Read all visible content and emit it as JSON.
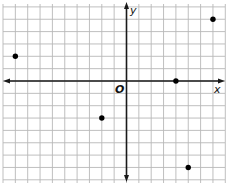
{
  "diagram": {
    "type": "coordinate-plane",
    "labels": {
      "x_axis": "x",
      "y_axis": "y",
      "origin": "O"
    },
    "grid": {
      "x_min": -10,
      "x_max": 8,
      "y_min": -8,
      "y_max": 6,
      "step": 1
    },
    "points": [
      {
        "x": -9,
        "y": 2
      },
      {
        "x": 7,
        "y": 5
      },
      {
        "x": 4,
        "y": 0
      },
      {
        "x": -2,
        "y": -3
      },
      {
        "x": 5,
        "y": -7
      }
    ],
    "colors": {
      "grid": "#b8b8b8",
      "axis": "#1a1a1a",
      "point": "#000000"
    }
  }
}
